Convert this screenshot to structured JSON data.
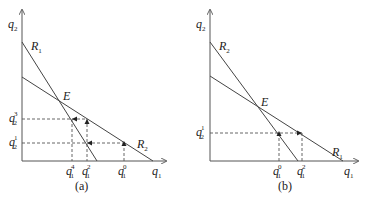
{
  "panels": [
    {
      "id": "a",
      "caption": "(a)",
      "axis_x": {
        "var": "q",
        "sub": "1"
      },
      "axis_y": {
        "var": "q",
        "sub": "2"
      },
      "curves": [
        {
          "var": "R",
          "sub": "1",
          "role": "steep"
        },
        {
          "var": "R",
          "sub": "2",
          "role": "flat"
        }
      ],
      "equilibrium": "E",
      "x_ticks": [
        {
          "var": "q",
          "sub": "1",
          "sup": "4"
        },
        {
          "var": "q",
          "sub": "1",
          "sup": "2"
        },
        {
          "var": "q",
          "sub": "1",
          "sup": "0"
        }
      ],
      "y_ticks": [
        {
          "var": "q",
          "sub": "2",
          "sup": "3"
        },
        {
          "var": "q",
          "sub": "2",
          "sup": "1"
        }
      ]
    },
    {
      "id": "b",
      "caption": "(b)",
      "axis_x": {
        "var": "q",
        "sub": "1"
      },
      "axis_y": {
        "var": "q",
        "sub": "2"
      },
      "curves": [
        {
          "var": "R",
          "sub": "2",
          "role": "steep"
        },
        {
          "var": "R",
          "sub": "1",
          "role": "flat"
        }
      ],
      "equilibrium": "E",
      "x_ticks": [
        {
          "var": "q",
          "sub": "1",
          "sup": "0"
        },
        {
          "var": "q",
          "sub": "1",
          "sup": "2"
        }
      ],
      "y_ticks": [
        {
          "var": "q",
          "sub": "2",
          "sup": "1"
        }
      ]
    }
  ]
}
